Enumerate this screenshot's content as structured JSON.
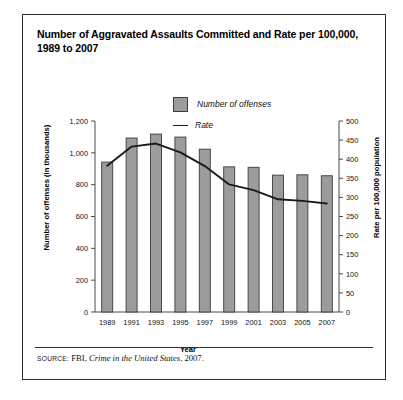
{
  "figure": {
    "title": "Number of Aggravated Assaults Committed and Rate per 100,000, 1989 to 2007",
    "source_keyword": "SOURCE:",
    "source_agency": " FBI, ",
    "source_publication": "Crime in the United States",
    "source_year": ", 2007."
  },
  "legend": {
    "bar_label": "Number of offenses",
    "line_label": "Rate",
    "bar_color": "#9c9c9c",
    "line_color": "#1a1a1a"
  },
  "chart_data": {
    "type": "bar",
    "title": "Number of Aggravated Assaults Committed and Rate per 100,000, 1989 to 2007",
    "xlabel": "Year",
    "ylabel": "Number of offenses (in thousands)",
    "y2label": "Rate per 100,000 population",
    "categories": [
      "1989",
      "1991",
      "1993",
      "1995",
      "1997",
      "1999",
      "2001",
      "2003",
      "2005",
      "2007"
    ],
    "series": [
      {
        "name": "Number of offenses",
        "type": "bar",
        "axis": "left",
        "values": [
          942,
          1093,
          1118,
          1099,
          1023,
          912,
          909,
          860,
          862,
          856
        ]
      },
      {
        "name": "Rate",
        "type": "line",
        "axis": "right",
        "values": [
          383,
          433,
          441,
          418,
          382,
          334,
          319,
          295,
          291,
          284
        ]
      }
    ],
    "ylim": [
      0,
      1200
    ],
    "yticks": [
      "0",
      "200",
      "400",
      "600",
      "800",
      "1,000",
      "1,200"
    ],
    "y2lim": [
      0,
      500
    ],
    "y2ticks": [
      "0",
      "50",
      "100",
      "150",
      "200",
      "250",
      "300",
      "350",
      "400",
      "450",
      "500"
    ],
    "grid": false,
    "legend_position": "top-center"
  }
}
